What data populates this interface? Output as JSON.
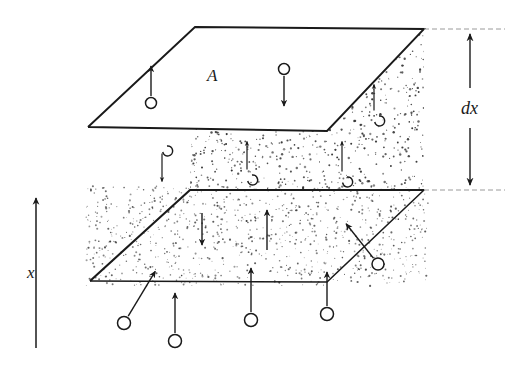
{
  "figure": {
    "kind": "physics-diagram",
    "colors": {
      "ink": "#1a1a1a",
      "stipple": "#2b2b2b",
      "background": "#ffffff"
    },
    "labels": {
      "area": "A",
      "thickness": "dx",
      "axis": "x"
    },
    "planes": {
      "top": {
        "name": "upper-plane",
        "points": "195,27 424,29 327,131 88,127"
      },
      "bottom": {
        "name": "lower-plane",
        "points": "190,190 424,190 327,282 90,281"
      }
    },
    "slab": {
      "name": "slab-volume",
      "points": "88,127 327,131 424,29 424,190 327,282 90,281 190,190 195,27",
      "stipple_density": 2300
    },
    "dimension": {
      "name": "dx-dimension",
      "x": 470,
      "top_y": 29,
      "bottom_y": 190,
      "guide_top": "424,29 505,29",
      "guide_bottom": "424,190 505,190"
    },
    "axis": {
      "name": "x-axis-arrow",
      "x": 36,
      "top_y": 196,
      "bottom_y": 348
    },
    "molecules": [
      {
        "name": "molecule-up-inside-top-plane",
        "cx": 151,
        "cy": 103,
        "r": 5.5,
        "dir": "up",
        "len": 30,
        "curl": false
      },
      {
        "name": "molecule-down-inside-top-plane",
        "cx": 284,
        "cy": 69,
        "r": 5.5,
        "dir": "down",
        "len": 30,
        "curl": false
      },
      {
        "name": "molecule-up-right-of-top-plane",
        "cx": 374,
        "cy": 117,
        "r": 5.0,
        "dir": "up",
        "len": 26,
        "curl": true
      },
      {
        "name": "molecule-down-below-top-plane",
        "cx": 162,
        "cy": 147,
        "r": 5.0,
        "dir": "down",
        "len": 28,
        "curl": true
      },
      {
        "name": "molecule-up-center-slab",
        "cx": 247,
        "cy": 176,
        "r": 5.0,
        "dir": "up",
        "len": 28,
        "curl": true
      },
      {
        "name": "molecule-up-right-slab",
        "cx": 342,
        "cy": 178,
        "r": 5.0,
        "dir": "up",
        "len": 30,
        "curl": true
      },
      {
        "name": "molecule-down-in-lower-slab",
        "cx": 202,
        "cy": 213,
        "r": 0.0,
        "dir": "down",
        "len": 32,
        "curl": false
      },
      {
        "name": "molecule-up-diagonal-right",
        "cx": 378,
        "cy": 264,
        "r": 6.0,
        "dir": "up-left",
        "len": 44,
        "curl": false
      },
      {
        "name": "molecule-up-diagonal-left-bottom",
        "cx": 124,
        "cy": 323,
        "r": 6.5,
        "dir": "up-right",
        "len": 52,
        "curl": false
      },
      {
        "name": "molecule-up-bottom-left",
        "cx": 175,
        "cy": 341,
        "r": 6.5,
        "dir": "up",
        "len": 40,
        "curl": false
      },
      {
        "name": "molecule-up-bottom-center",
        "cx": 251,
        "cy": 320,
        "r": 6.5,
        "dir": "up",
        "len": 44,
        "curl": false
      },
      {
        "name": "molecule-up-bottom-right",
        "cx": 327,
        "cy": 314,
        "r": 6.5,
        "dir": "up",
        "len": 34,
        "curl": false
      },
      {
        "name": "molecule-up-inside-lower-plane",
        "cx": 267,
        "cy": 250,
        "r": 0.0,
        "dir": "up",
        "len": 40,
        "curl": false
      }
    ]
  }
}
